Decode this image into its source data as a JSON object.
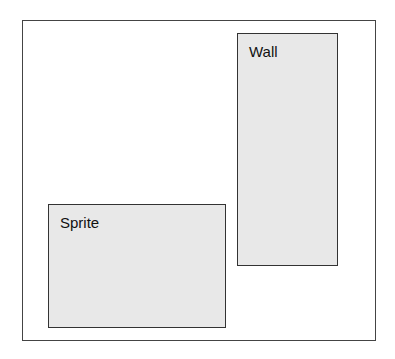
{
  "diagram": {
    "frame": {
      "label": ""
    },
    "boxes": [
      {
        "id": "wall",
        "label": "Wall",
        "fill": "#e8e8e8"
      },
      {
        "id": "sprite",
        "label": "Sprite",
        "fill": "#e8e8e8"
      }
    ]
  }
}
